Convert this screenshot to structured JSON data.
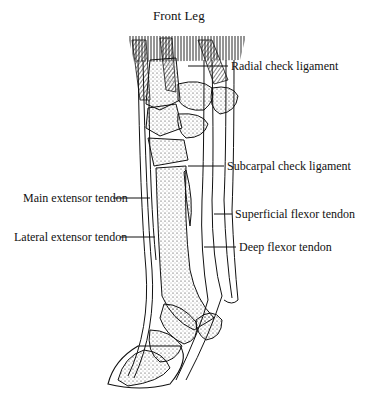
{
  "title": "Front Leg",
  "labels": {
    "radial_check": "Radial check ligament",
    "subcarpal_check": "Subcarpal check ligament",
    "main_extensor": "Main extensor tendon",
    "superficial_flexor": "Superficial flexor tendon",
    "lateral_extensor": "Lateral extensor tendon",
    "deep_flexor": "Deep flexor tendon"
  },
  "colors": {
    "ink": "#111111",
    "background": "#ffffff"
  }
}
